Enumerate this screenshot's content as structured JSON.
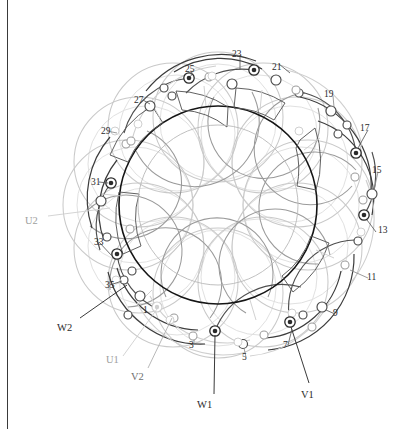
{
  "figure": {
    "type": "circular-winding-schematic",
    "background_color": "#ffffff",
    "page_edge_color": "#3a3a3a",
    "stator_ring_color": "#1a1a1a",
    "coil_dark_color": "#4a4a4a",
    "coil_mid_color": "#8c8c8c",
    "coil_light_color": "#c9c9c9",
    "coil_faint_color": "#dcdcdc"
  },
  "geometry": {
    "center_x": 218,
    "center_y": 205,
    "stator_outer_radius": 99,
    "stator_inner_radius": 78,
    "slot_count": 36,
    "pole_groups": 6
  },
  "slot_labels": [
    {
      "id": "1",
      "text": "1",
      "x": 143,
      "y": 306,
      "tone": "light"
    },
    {
      "id": "3",
      "text": "3",
      "x": 189,
      "y": 341,
      "tone": "mid"
    },
    {
      "id": "5",
      "text": "5",
      "x": 242,
      "y": 353,
      "tone": "mid"
    },
    {
      "id": "7",
      "text": "7",
      "x": 283,
      "y": 341,
      "tone": "dark"
    },
    {
      "id": "9",
      "text": "9",
      "x": 333,
      "y": 309,
      "tone": "dark"
    },
    {
      "id": "11",
      "text": "11",
      "x": 367,
      "y": 273,
      "tone": "mid"
    },
    {
      "id": "13",
      "text": "13",
      "x": 378,
      "y": 226,
      "tone": "dark"
    },
    {
      "id": "15",
      "text": "15",
      "x": 372,
      "y": 166,
      "tone": "mid"
    },
    {
      "id": "17",
      "text": "17",
      "x": 360,
      "y": 124,
      "tone": "dark"
    },
    {
      "id": "19",
      "text": "19",
      "x": 324,
      "y": 90,
      "tone": "mid"
    },
    {
      "id": "21",
      "text": "21",
      "x": 272,
      "y": 63,
      "tone": "dark"
    },
    {
      "id": "23",
      "text": "23",
      "x": 232,
      "y": 50,
      "tone": "dark"
    },
    {
      "id": "25",
      "text": "25",
      "x": 185,
      "y": 65,
      "tone": "dark"
    },
    {
      "id": "27",
      "text": "27",
      "x": 134,
      "y": 96,
      "tone": "dark"
    },
    {
      "id": "29",
      "text": "29",
      "x": 101,
      "y": 127,
      "tone": "mid"
    },
    {
      "id": "31",
      "text": "31",
      "x": 91,
      "y": 178,
      "tone": "dark"
    },
    {
      "id": "33",
      "text": "33",
      "x": 94,
      "y": 238,
      "tone": "dark"
    },
    {
      "id": "35",
      "text": "35",
      "x": 105,
      "y": 281,
      "tone": "dark"
    }
  ],
  "terminal_labels": [
    {
      "id": "U1",
      "text": "U1",
      "x": 106,
      "y": 355,
      "tone": "light"
    },
    {
      "id": "U2",
      "text": "U2",
      "x": 25,
      "y": 216,
      "tone": "light"
    },
    {
      "id": "V1",
      "text": "V1",
      "x": 301,
      "y": 390,
      "tone": "dark"
    },
    {
      "id": "V2",
      "text": "V2",
      "x": 131,
      "y": 372,
      "tone": "mid"
    },
    {
      "id": "W1",
      "text": "W1",
      "x": 197,
      "y": 400,
      "tone": "dark"
    },
    {
      "id": "W2",
      "text": "W2",
      "x": 57,
      "y": 323,
      "tone": "dark"
    }
  ],
  "terminal_markers": [
    {
      "id": "T-W1",
      "slot": "1",
      "x": 215,
      "y": 331,
      "style": "ring"
    },
    {
      "id": "T-V1",
      "slot": "7",
      "x": 290,
      "y": 322,
      "style": "ring"
    },
    {
      "id": "T-13",
      "slot": "13",
      "x": 364,
      "y": 215,
      "style": "ring"
    },
    {
      "id": "T-17",
      "slot": "17",
      "x": 356,
      "y": 153,
      "style": "ring"
    },
    {
      "id": "T-21",
      "slot": "21",
      "x": 254,
      "y": 70,
      "style": "ring"
    },
    {
      "id": "T-25",
      "slot": "25",
      "x": 189,
      "y": 78,
      "style": "ring"
    },
    {
      "id": "T-31",
      "slot": "31",
      "x": 111,
      "y": 183,
      "style": "ring"
    },
    {
      "id": "T-33",
      "slot": "33",
      "x": 117,
      "y": 254,
      "style": "ring"
    },
    {
      "id": "T-U1",
      "slot": "1",
      "x": 157,
      "y": 307,
      "style": "ring-light"
    }
  ]
}
